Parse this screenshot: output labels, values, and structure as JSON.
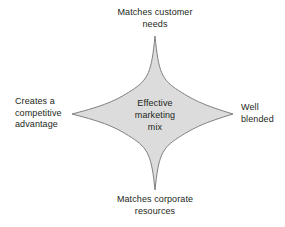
{
  "diagram": {
    "type": "four-pointed-star",
    "title": "Effective marketing mix",
    "center": {
      "text": "Effective\nmarketing\nmix"
    },
    "shape": {
      "fill_color": "#dcdcdc",
      "stroke_color": "#808080",
      "stroke_width": 1,
      "background_color": "#ffffff",
      "center_x": 155,
      "center_y": 114,
      "tip_top": {
        "x": 155,
        "y": 36
      },
      "tip_bottom": {
        "x": 155,
        "y": 190
      },
      "tip_left": {
        "x": 72,
        "y": 114
      },
      "tip_right": {
        "x": 233,
        "y": 114
      }
    },
    "points": [
      {
        "id": "top",
        "label": "Matches customer\nneeds",
        "align": "center"
      },
      {
        "id": "right",
        "label": "Well\nblended",
        "align": "left"
      },
      {
        "id": "bottom",
        "label": "Matches corporate\nresources",
        "align": "center"
      },
      {
        "id": "left",
        "label": "Creates a\ncompetitive\nadvantage",
        "align": "left"
      }
    ],
    "text_color": "#231f20"
  }
}
